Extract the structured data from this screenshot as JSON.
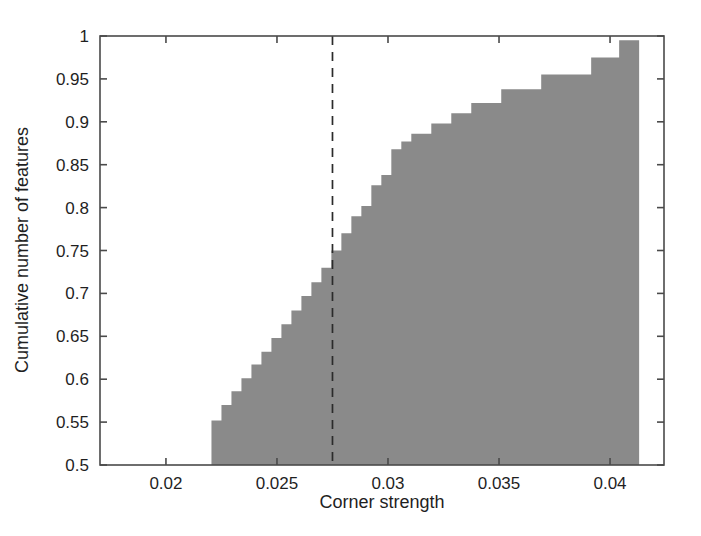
{
  "chart_data": {
    "type": "line",
    "subtype": "empirical-cumulative-distribution-step-area",
    "title": "",
    "xlabel": "Corner strength",
    "ylabel": "Cumulative number of features",
    "xlim": [
      0.01703,
      0.04243
    ],
    "ylim": [
      0.5,
      1.0
    ],
    "xticks": [
      0.02,
      0.025,
      0.03,
      0.035,
      0.04
    ],
    "xticklabels": [
      "0.02",
      "0.025",
      "0.03",
      "0.035",
      "0.04"
    ],
    "yticks": [
      0.5,
      0.55,
      0.6,
      0.65,
      0.7,
      0.75,
      0.8,
      0.85,
      0.9,
      0.95,
      1
    ],
    "yticklabels": [
      "0.5",
      "0.55",
      "0.6",
      "0.65",
      "0.7",
      "0.75",
      "0.8",
      "0.85",
      "0.9",
      "0.95",
      "1"
    ],
    "grid": false,
    "legend": null,
    "box": true,
    "fill_color": "#8a8a8a",
    "fill_below_to": 0.5,
    "series": [
      {
        "name": "Cumulative feature distribution",
        "style": "step-post",
        "x": [
          0.02205,
          0.0225,
          0.02295,
          0.0234,
          0.02385,
          0.0243,
          0.02475,
          0.0252,
          0.02565,
          0.0261,
          0.02655,
          0.027,
          0.02745,
          0.0279,
          0.02835,
          0.0288,
          0.02925,
          0.0297,
          0.03015,
          0.0306,
          0.03105,
          0.03195,
          0.03285,
          0.03375,
          0.0351,
          0.0369,
          0.03915,
          0.04041,
          0.04131
        ],
        "y": [
          0.552,
          0.57,
          0.586,
          0.601,
          0.617,
          0.632,
          0.648,
          0.664,
          0.68,
          0.697,
          0.713,
          0.73,
          0.75,
          0.77,
          0.79,
          0.802,
          0.826,
          0.838,
          0.868,
          0.877,
          0.886,
          0.898,
          0.91,
          0.922,
          0.938,
          0.955,
          0.975,
          0.995,
          1.0
        ]
      }
    ],
    "annotations": [
      {
        "name": "threshold-line",
        "type": "vline",
        "x": 0.0275,
        "style": "dashed",
        "color": "#2b2b2b"
      },
      {
        "name": "stray-speck",
        "type": "point",
        "x": 0.0119,
        "y": 0.9444,
        "color": "#d8d8d8"
      }
    ]
  },
  "axes": {
    "x_title": "Corner strength",
    "y_title": "Cumulative number of features",
    "x_tick_labels": [
      "0.02",
      "0.025",
      "0.03",
      "0.035",
      "0.04"
    ],
    "y_tick_labels": [
      "1",
      "0.95",
      "0.9",
      "0.85",
      "0.8",
      "0.75",
      "0.7",
      "0.65",
      "0.6",
      "0.55",
      "0.5"
    ]
  }
}
